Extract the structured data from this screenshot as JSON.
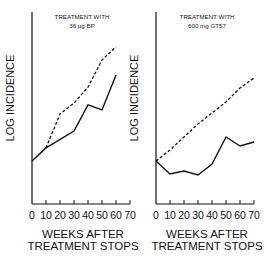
{
  "chart_data": [
    {
      "type": "line",
      "title": "TREATMENT WITH",
      "subtitle": "36 µg BP",
      "xlabel": "WEEKS AFTER TREATMENT STOPS",
      "xlabel_lines": [
        "WEEKS AFTER",
        "TREATMENT STOPS"
      ],
      "ylabel": "LOG INCIDENCE",
      "x_ticks": [
        0,
        10,
        20,
        30,
        40,
        50,
        60,
        70
      ],
      "xlim": [
        0,
        70
      ],
      "ylim": [
        0,
        100
      ],
      "y_units": "relative (no tick labels shown)",
      "grid": false,
      "legend": "none",
      "series": [
        {
          "name": "solid",
          "style": "solid",
          "x": [
            0,
            10,
            30,
            40,
            50,
            60
          ],
          "values": [
            22.4,
            29.2,
            38.0,
            51.6,
            49.0,
            67.2
          ]
        },
        {
          "name": "dashed",
          "style": "dashed",
          "x": [
            10,
            20,
            30,
            40,
            50,
            60
          ],
          "values": [
            29.2,
            46.9,
            52.6,
            60.9,
            75.0,
            81.8
          ]
        }
      ]
    },
    {
      "type": "line",
      "title": "TREATMENT WITH",
      "subtitle": "600 mg GT57",
      "xlabel": "WEEKS AFTER TREATMENT STOPS",
      "xlabel_lines": [
        "WEEKS AFTER",
        "TREATMENT STOPS"
      ],
      "ylabel": "LOG INCIDENCE",
      "x_ticks": [
        0,
        10,
        20,
        30,
        40,
        50,
        60,
        70
      ],
      "xlim": [
        0,
        70
      ],
      "ylim": [
        0,
        100
      ],
      "y_units": "relative (no tick labels shown)",
      "grid": false,
      "legend": "none",
      "series": [
        {
          "name": "solid",
          "style": "solid",
          "x": [
            0,
            10,
            20,
            30,
            40,
            50,
            60,
            70
          ],
          "values": [
            22.4,
            15.6,
            17.2,
            15.1,
            20.8,
            34.9,
            30.2,
            32.3
          ]
        },
        {
          "name": "dashed",
          "style": "dashed",
          "x": [
            0,
            10,
            20,
            30,
            40,
            50,
            60,
            70
          ],
          "values": [
            22.4,
            28.1,
            34.9,
            41.7,
            47.4,
            53.1,
            60.4,
            65.6
          ]
        }
      ]
    }
  ],
  "colors": {
    "line": "#111111",
    "background": "#ffffff"
  }
}
